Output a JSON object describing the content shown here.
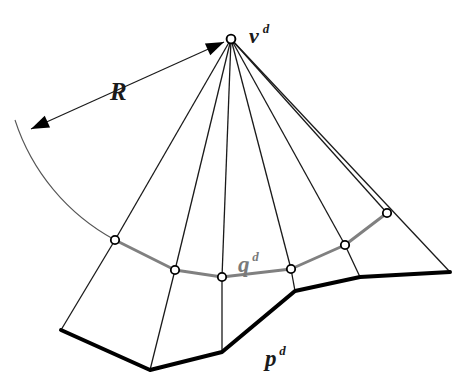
{
  "figure": {
    "type": "geometric-diagram",
    "background_color": "#ffffff",
    "colors": {
      "thin_line": "#1a1a1a",
      "thick_line": "#000000",
      "gray_polyline": "#808080",
      "gray_label": "#7a7a7a",
      "arc_line": "#555555",
      "marker_fill": "#ffffff",
      "marker_stroke": "#000000"
    },
    "labels": [
      {
        "id": "apex-label",
        "base": "v",
        "superscript": "d",
        "x": 249,
        "y": 26,
        "font_size": 22,
        "sup_font_size": 13,
        "color": "#1a1a1a"
      },
      {
        "id": "radius-label",
        "base": "R",
        "superscript": "",
        "x": 110,
        "y": 80,
        "font_size": 25,
        "sup_font_size": 13,
        "color": "#1a1a1a"
      },
      {
        "id": "q-curve-label",
        "base": "q",
        "superscript": "d",
        "x": 238,
        "y": 254,
        "font_size": 23,
        "sup_font_size": 13,
        "color": "#7a7a7a"
      },
      {
        "id": "p-curve-label",
        "base": "p",
        "superscript": "d",
        "x": 265,
        "y": 348,
        "font_size": 23,
        "sup_font_size": 13,
        "color": "#1a1a1a"
      }
    ],
    "apex": {
      "x": 231,
      "y": 39
    },
    "q_polyline_points": "115,240 175,270 222,277 291,269 345,245 387,213",
    "p_polyline_points": "61,330 150,370 222,352 295,291 360,277 450,272",
    "markers": [
      {
        "id": "marker-1",
        "x": 115,
        "y": 240
      },
      {
        "id": "marker-2",
        "x": 175,
        "y": 270
      },
      {
        "id": "marker-3",
        "x": 222,
        "y": 277
      },
      {
        "id": "marker-4",
        "x": 291,
        "y": 269
      },
      {
        "id": "marker-5",
        "x": 345,
        "y": 245
      },
      {
        "id": "marker-6",
        "x": 387,
        "y": 213
      }
    ],
    "apex_marker": {
      "id": "marker-apex",
      "x": 231,
      "y": 39
    },
    "rays": [
      {
        "id": "ray-1",
        "x2": 115,
        "y2": 240
      },
      {
        "id": "ray-2",
        "x2": 175,
        "y2": 270
      },
      {
        "id": "ray-3",
        "x2": 222,
        "y2": 277
      },
      {
        "id": "ray-4",
        "x2": 291,
        "y2": 269
      },
      {
        "id": "ray-5",
        "x2": 345,
        "y2": 245
      },
      {
        "id": "ray-6",
        "x2": 387,
        "y2": 213
      },
      {
        "id": "ray-7",
        "x2": 450,
        "y2": 272
      }
    ],
    "side_edges": [
      {
        "id": "edge-1",
        "x1": 115,
        "y1": 240,
        "x2": 61,
        "y2": 330
      },
      {
        "id": "edge-2",
        "x1": 175,
        "y1": 270,
        "x2": 150,
        "y2": 370
      },
      {
        "id": "edge-3",
        "x1": 222,
        "y1": 277,
        "x2": 222,
        "y2": 352
      },
      {
        "id": "edge-4",
        "x1": 291,
        "y1": 269,
        "x2": 295,
        "y2": 291
      },
      {
        "id": "edge-5",
        "x1": 345,
        "y1": 245,
        "x2": 360,
        "y2": 277
      }
    ],
    "radius_arc": {
      "id": "radius-arc",
      "path": "M 15,120 A 210,210 0 0 0 115,240"
    },
    "radius_arrow": {
      "id": "radius-arrow-line",
      "x1": 224,
      "y1": 42,
      "x2": 31,
      "y2": 129
    }
  }
}
